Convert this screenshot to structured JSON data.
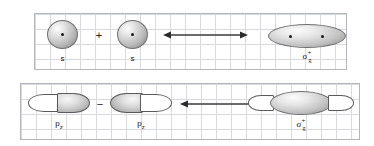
{
  "figure": {
    "background_color": "#ffffff",
    "grid_color": "#d9d9e0",
    "panel_border_color": "#b5b5bd",
    "orbital_outline_color": "#5a5a5a",
    "nucleus_color": "#1a1a1a"
  },
  "rows": [
    {
      "id": "s-combination",
      "operator": "+",
      "arrow": "double-headed-arrow",
      "reactants": [
        {
          "label": "s",
          "type": "sphere",
          "nuclei": 1
        },
        {
          "label": "s",
          "type": "sphere",
          "nuclei": 1
        }
      ],
      "product": {
        "symbol": "σ",
        "superscript": "+",
        "subscript": "g",
        "type": "ellipse",
        "nuclei": 2
      }
    },
    {
      "id": "pz-combination",
      "operator": "−",
      "arrow": "double-headed-arrow",
      "reactants": [
        {
          "label": "p",
          "sublabel": "z",
          "type": "p-orbital",
          "orientation": "white-left-gray-right"
        },
        {
          "label": "p",
          "sublabel": "z",
          "type": "p-orbital",
          "orientation": "gray-left-white-right"
        }
      ],
      "product": {
        "symbol": "σ",
        "superscript": "+",
        "subscript": "g",
        "type": "ellipse-with-outer-lobes",
        "nuclei": 0
      }
    }
  ]
}
